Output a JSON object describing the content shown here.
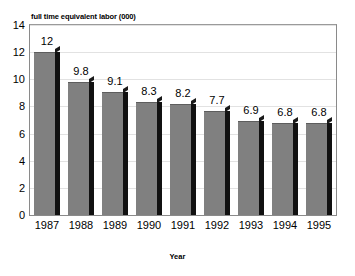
{
  "chart_data": {
    "type": "bar",
    "title": "full time equivalent labor (000)",
    "xlabel": "Year",
    "ylabel": "",
    "categories": [
      "1987",
      "1988",
      "1989",
      "1990",
      "1991",
      "1992",
      "1993",
      "1994",
      "1995"
    ],
    "values": [
      12,
      9.8,
      9.1,
      8.3,
      8.2,
      7.7,
      6.9,
      6.8,
      6.8
    ],
    "data_labels": [
      "12",
      "9.8",
      "9.1",
      "8.3",
      "8.2",
      "7.7",
      "6.9",
      "6.8",
      "6.8"
    ],
    "ylim": [
      0,
      14
    ],
    "yticks": [
      0,
      2,
      4,
      6,
      8,
      10,
      12,
      14
    ],
    "ytick_labels": [
      "0",
      "2",
      "4",
      "6",
      "8",
      "10",
      "12",
      "14"
    ],
    "grid": true,
    "legend": false,
    "legend_position": "none",
    "series": [
      {
        "name": "full time equivalent labor (000)",
        "values": [
          12,
          9.8,
          9.1,
          8.3,
          8.2,
          7.7,
          6.9,
          6.8,
          6.8
        ]
      }
    ],
    "colors": {
      "bar_face": "#808080",
      "bar_side": "#111111",
      "gridline": "#e2e2e2",
      "frame": "#8a8a8a",
      "background": "#ffffff",
      "text": "#000000"
    }
  }
}
